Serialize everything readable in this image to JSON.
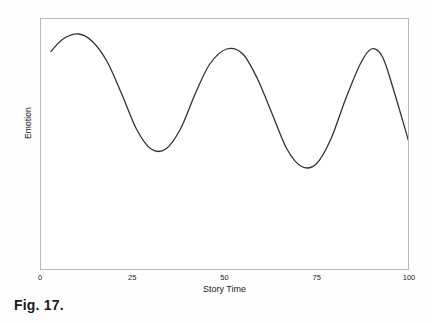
{
  "figure": {
    "caption": "Fig. 17."
  },
  "chart_data": {
    "type": "line",
    "title": "",
    "subtitle": "",
    "xlabel": "Story Time",
    "ylabel": "Emotion",
    "xlim": [
      0,
      100
    ],
    "ylim": [
      0,
      100
    ],
    "grid": false,
    "legend": null,
    "legend_position": "none",
    "xticks": [
      "0",
      "25",
      "50",
      "75",
      "100"
    ],
    "xtick_values": [
      0,
      25,
      50,
      75,
      100
    ],
    "yticks": [],
    "annotations": [],
    "line_color": "#333333",
    "line_width": 1.3,
    "axis_color": "#b9b9b9",
    "background_color": "#ffffff",
    "series": [
      {
        "name": "Emotion over story time",
        "description": "Three-crest oscillating emotional arc that decays to a low plateau at the end",
        "points": [
          {
            "x": 2.7,
            "y": 87
          },
          {
            "x": 6.0,
            "y": 92
          },
          {
            "x": 10.3,
            "y": 94
          },
          {
            "x": 14.0,
            "y": 91
          },
          {
            "x": 18.0,
            "y": 83
          },
          {
            "x": 22.0,
            "y": 70
          },
          {
            "x": 26.0,
            "y": 56
          },
          {
            "x": 30.0,
            "y": 48
          },
          {
            "x": 34.0,
            "y": 48
          },
          {
            "x": 38.0,
            "y": 56
          },
          {
            "x": 42.0,
            "y": 70
          },
          {
            "x": 46.0,
            "y": 82
          },
          {
            "x": 50.6,
            "y": 88
          },
          {
            "x": 55.0,
            "y": 86
          },
          {
            "x": 59.0,
            "y": 76
          },
          {
            "x": 63.0,
            "y": 62
          },
          {
            "x": 67.0,
            "y": 48
          },
          {
            "x": 71.0,
            "y": 41
          },
          {
            "x": 75.0,
            "y": 42
          },
          {
            "x": 79.0,
            "y": 52
          },
          {
            "x": 83.0,
            "y": 68
          },
          {
            "x": 87.0,
            "y": 82
          },
          {
            "x": 90.0,
            "y": 88
          },
          {
            "x": 93.0,
            "y": 85
          },
          {
            "x": 96.0,
            "y": 72
          },
          {
            "x": 100.0,
            "y": 52
          },
          {
            "x": 104.0,
            "y": 32
          },
          {
            "x": 108.0,
            "y": 18
          },
          {
            "x": 112.0,
            "y": 10
          },
          {
            "x": 116.0,
            "y": 7
          },
          {
            "x": 120.0,
            "y": 6
          }
        ],
        "peaks": [
          {
            "x": 10,
            "y": 94,
            "label": "first crest"
          },
          {
            "x": 41,
            "y": 88,
            "label": "second crest"
          },
          {
            "x": 75,
            "y": 89,
            "label": "third crest"
          }
        ],
        "troughs": [
          {
            "x": 25,
            "y": 48,
            "label": "first trough"
          },
          {
            "x": 58,
            "y": 39,
            "label": "second trough"
          }
        ],
        "end_value": {
          "x": 100,
          "y": 6,
          "label": "final plateau"
        }
      }
    ]
  }
}
